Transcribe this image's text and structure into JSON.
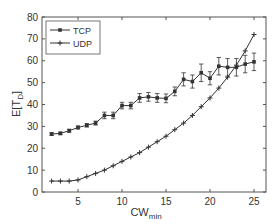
{
  "chart_data": {
    "type": "line",
    "title": "",
    "xlabel": "CW",
    "xlabel_sub": "min",
    "ylabel": "E[T",
    "ylabel_sub": "D",
    "ylabel_suffix": "]",
    "xlim": [
      1.5,
      26
    ],
    "ylim": [
      0,
      80
    ],
    "xticks": [
      5,
      10,
      15,
      20,
      25
    ],
    "yticks": [
      0,
      10,
      20,
      30,
      40,
      50,
      60,
      70,
      80
    ],
    "grid": false,
    "legend_position": "upper left",
    "x": [
      2,
      3,
      4,
      5,
      6,
      7,
      8,
      9,
      10,
      11,
      12,
      13,
      14,
      15,
      16,
      17,
      18,
      19,
      20,
      21,
      22,
      23,
      24,
      25
    ],
    "series": [
      {
        "name": "TCP",
        "marker": "dot",
        "error_bars": true,
        "values": [
          26.5,
          26.8,
          28,
          29.5,
          30.5,
          31.5,
          35,
          35,
          39.5,
          39.5,
          43,
          43.5,
          43,
          42.8,
          46,
          51.5,
          50.5,
          54.5,
          52,
          57.5,
          57,
          57,
          58.5,
          59.5
        ],
        "errors": [
          0.6,
          0.6,
          0.7,
          0.7,
          0.8,
          0.9,
          1.5,
          1.5,
          1.5,
          1.5,
          2,
          2,
          2,
          2,
          2,
          3,
          3,
          4,
          3,
          4,
          4,
          4,
          4,
          4
        ]
      },
      {
        "name": "UDP",
        "marker": "plus",
        "error_bars": false,
        "values": [
          5,
          5,
          5,
          5.5,
          7,
          8.5,
          10,
          12,
          14,
          16,
          18,
          20.5,
          23,
          25.5,
          28.5,
          31.5,
          35,
          39,
          43,
          47.5,
          52.5,
          58,
          64.5,
          72
        ]
      }
    ]
  },
  "colors": {
    "line": "#333333",
    "axis": "#555555",
    "background": "#ffffff"
  }
}
